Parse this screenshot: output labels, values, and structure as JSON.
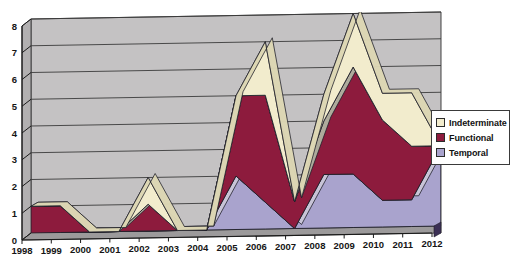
{
  "chart_data": {
    "type": "area",
    "title": "",
    "subtitle": "",
    "xlabel": "",
    "ylabel": "",
    "stacked": true,
    "three_d": true,
    "grid": true,
    "legend_position": "right",
    "ylim": [
      0,
      8
    ],
    "ytick_labels": [
      "0",
      "1",
      "2",
      "3",
      "4",
      "5",
      "6",
      "7",
      "8"
    ],
    "categories": [
      "1998",
      "1999",
      "2000",
      "2001",
      "2002",
      "2003",
      "2004",
      "2005",
      "2006",
      "2007",
      "2008",
      "2009",
      "2010",
      "2011",
      "2012"
    ],
    "series": [
      {
        "name": "Temporal",
        "color": "#a9a3cd",
        "values": [
          0,
          0,
          0,
          0,
          0,
          0,
          0,
          2,
          1,
          0,
          2,
          2,
          1,
          1,
          3
        ]
      },
      {
        "name": "Functional",
        "color": "#8d1b3d",
        "values": [
          1,
          1,
          0,
          0,
          1,
          0,
          0,
          3,
          4,
          1,
          2,
          4,
          3,
          2,
          0
        ]
      },
      {
        "name": "Indeterminate",
        "color": "#f2eccd",
        "values": [
          0,
          0,
          0,
          0,
          1,
          0,
          0,
          0,
          2,
          0,
          1,
          2,
          1,
          2,
          0
        ]
      }
    ],
    "stack_totals": [
      1,
      1,
      0,
      0,
      2,
      0,
      0,
      5,
      7,
      1,
      5,
      8,
      5,
      5,
      3
    ]
  },
  "legend": {
    "items": [
      {
        "label": "Indeterminate",
        "color": "#f2eccd"
      },
      {
        "label": "Functional",
        "color": "#8d1b3d"
      },
      {
        "label": "Temporal",
        "color": "#a9a3cd"
      }
    ]
  },
  "colors": {
    "plot_wall": "#c4c2c3",
    "plot_floor": "#9c9a9b",
    "gridline": "#3b3b3b",
    "axis": "#1a1a1a",
    "background": "#ffffff"
  }
}
